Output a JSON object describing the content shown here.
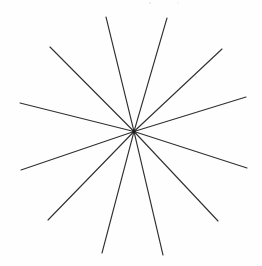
{
  "figure": {
    "canvas": {
      "width": 262,
      "height": 266
    },
    "background_color": "#fefefe",
    "line_color": "#2f2f2f",
    "line_width": 1.1,
    "center": {
      "x": 134,
      "y": 131.5
    },
    "center_knot": {
      "radius": 1.7,
      "color": "#1c1c1c"
    },
    "ray_count": 12,
    "rays": [
      {
        "x": 106,
        "y": 17
      },
      {
        "x": 167,
        "y": 18
      },
      {
        "x": 222,
        "y": 49
      },
      {
        "x": 246,
        "y": 97
      },
      {
        "x": 247,
        "y": 168
      },
      {
        "x": 218,
        "y": 221
      },
      {
        "x": 163,
        "y": 255
      },
      {
        "x": 102,
        "y": 253
      },
      {
        "x": 48,
        "y": 220
      },
      {
        "x": 21,
        "y": 170
      },
      {
        "x": 20,
        "y": 103
      },
      {
        "x": 50,
        "y": 47
      }
    ],
    "specks": [
      {
        "x": 150,
        "y": 3,
        "radius": 1.2,
        "opacity": 0.1
      },
      {
        "x": 178,
        "y": 3,
        "radius": 0.9,
        "opacity": 0.08
      },
      {
        "x": 196,
        "y": 77,
        "radius": 1.0,
        "opacity": 0.15
      }
    ]
  }
}
